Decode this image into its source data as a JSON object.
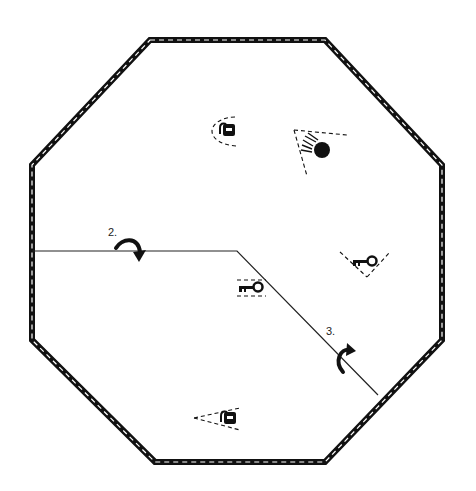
{
  "diagram": {
    "type": "floor-plan-octagon",
    "colors": {
      "wall": "#111111",
      "wall_dash": "#ffffff",
      "path": "#222222",
      "icon": "#111111",
      "background": "#ffffff"
    },
    "labels": {
      "step2": "2.",
      "step3": "3."
    },
    "icons": [
      {
        "id": "lock-top",
        "kind": "padlock-icon",
        "x": 226,
        "y": 130,
        "view_direction": "left"
      },
      {
        "id": "camera-top-right",
        "kind": "camera-icon",
        "x": 320,
        "y": 148,
        "view_direction": "upper-left"
      },
      {
        "id": "key-right",
        "kind": "key-icon",
        "x": 365,
        "y": 261,
        "view_direction": "down"
      },
      {
        "id": "key-center",
        "kind": "key-icon",
        "x": 252,
        "y": 287,
        "view_direction": "none"
      },
      {
        "id": "lock-bottom",
        "kind": "padlock-icon",
        "x": 228,
        "y": 417,
        "view_direction": "left"
      }
    ],
    "arrows": [
      {
        "id": "turn-arrow-2",
        "label": "2.",
        "direction": "clockwise-down"
      },
      {
        "id": "turn-arrow-3",
        "label": "3.",
        "direction": "counterclockwise-up"
      }
    ]
  }
}
